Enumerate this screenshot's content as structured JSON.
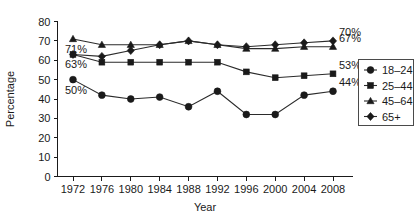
{
  "chart_data": {
    "type": "line",
    "title": "",
    "xlabel": "Year",
    "ylabel": "Percentage",
    "x": [
      1972,
      1976,
      1980,
      1984,
      1988,
      1992,
      1996,
      2000,
      2004,
      2008
    ],
    "xticklabels": [
      "1972",
      "1976",
      "1980",
      "1984",
      "1988",
      "1992",
      "1996",
      "2000",
      "2004",
      "2008"
    ],
    "yticks": [
      0,
      10,
      20,
      30,
      40,
      50,
      60,
      70,
      80
    ],
    "yticklabels": [
      "0",
      "10",
      "20",
      "30",
      "40",
      "50",
      "60",
      "70",
      "80"
    ],
    "ylim": [
      0,
      80
    ],
    "grid": false,
    "legend_position": "right",
    "series": [
      {
        "name": "18–24",
        "marker": "circle",
        "values": [
          50,
          42,
          40,
          41,
          36,
          44,
          32,
          32,
          42,
          44
        ],
        "start_label": "50%",
        "end_label": "44%"
      },
      {
        "name": "25–44",
        "marker": "square",
        "values": [
          63,
          59,
          59,
          59,
          59,
          59,
          54,
          51,
          52,
          53
        ],
        "start_label": "63%",
        "end_label": "53%"
      },
      {
        "name": "45–64",
        "marker": "triangle",
        "values": [
          71,
          68,
          68,
          68,
          70,
          68,
          66,
          66,
          67,
          67
        ],
        "start_label": "71%",
        "end_label": "67%"
      },
      {
        "name": "65+",
        "marker": "diamond",
        "values": [
          63,
          62,
          65,
          68,
          70,
          68,
          67,
          68,
          69,
          70
        ],
        "start_label": "",
        "end_label": "70%"
      }
    ],
    "annotations": [
      {
        "text": "71%",
        "series": "45–64",
        "side": "left"
      },
      {
        "text": "63%",
        "series": "25–44",
        "side": "left"
      },
      {
        "text": "50%",
        "series": "18–24",
        "side": "left"
      },
      {
        "text": "70%",
        "series": "65+",
        "side": "right"
      },
      {
        "text": "67%",
        "series": "45–64",
        "side": "right"
      },
      {
        "text": "53%",
        "series": "25–44",
        "side": "right"
      },
      {
        "text": "44%",
        "series": "18–24",
        "side": "right"
      }
    ],
    "legend_entries": [
      "18–24",
      "25–44",
      "45–64",
      "65+"
    ],
    "colors": {
      "line": "#2b2b2b",
      "marker": "#1a1a1a",
      "axis": "#1a1a1a",
      "text": "#1a1a1a",
      "background": "#ffffff",
      "legend_border": "#4a4a4a"
    }
  }
}
